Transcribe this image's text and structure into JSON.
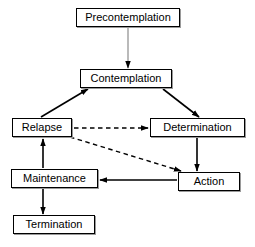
{
  "diagram": {
    "width": 255,
    "height": 247,
    "background_color": "#ffffff",
    "node_border_color": "#000000",
    "node_fill_color": "#ffffff",
    "node_shadow_color": "#9a9a9a",
    "solid_edge_color": "#000000",
    "faint_edge_color": "#8c8c8c",
    "dashed_edge_color": "#000000",
    "arrowhead_color": "#000000"
  },
  "nodes": [
    {
      "id": "precontemplation",
      "label": "Precontemplation",
      "x": 76,
      "y": 8,
      "w": 104,
      "h": 19
    },
    {
      "id": "contemplation",
      "label": "Contemplation",
      "x": 80,
      "y": 69,
      "w": 92,
      "h": 19
    },
    {
      "id": "relapse",
      "label": "Relapse",
      "x": 12,
      "y": 118,
      "w": 60,
      "h": 19
    },
    {
      "id": "determination",
      "label": "Determination",
      "x": 150,
      "y": 118,
      "w": 95,
      "h": 19
    },
    {
      "id": "maintenance",
      "label": "Maintenance",
      "x": 11,
      "y": 169,
      "w": 87,
      "h": 19
    },
    {
      "id": "action",
      "label": "Action",
      "x": 178,
      "y": 172,
      "w": 62,
      "h": 19
    },
    {
      "id": "termination",
      "label": "Termination",
      "x": 13,
      "y": 215,
      "w": 82,
      "h": 19
    }
  ],
  "edges": [
    {
      "id": "precontemplation-to-contemplation",
      "from": "precontemplation",
      "to": "contemplation",
      "style": "solid-faint",
      "x1": 128,
      "y1": 27,
      "x2": 128,
      "y2": 68
    },
    {
      "id": "relapse-to-contemplation",
      "from": "relapse",
      "to": "contemplation",
      "style": "solid",
      "x1": 41,
      "y1": 117,
      "x2": 88,
      "y2": 89
    },
    {
      "id": "contemplation-to-determination",
      "from": "contemplation",
      "to": "determination",
      "style": "solid",
      "x1": 163,
      "y1": 89,
      "x2": 199,
      "y2": 117
    },
    {
      "id": "relapse-to-determination",
      "from": "relapse",
      "to": "determination",
      "style": "dashed",
      "x1": 74,
      "y1": 128,
      "x2": 148,
      "y2": 128
    },
    {
      "id": "relapse-to-action",
      "from": "relapse",
      "to": "action",
      "style": "dashed",
      "x1": 70,
      "y1": 137,
      "x2": 181,
      "y2": 171
    },
    {
      "id": "determination-to-action",
      "from": "determination",
      "to": "action",
      "style": "solid",
      "x1": 197,
      "y1": 138,
      "x2": 197,
      "y2": 171
    },
    {
      "id": "action-to-maintenance",
      "from": "action",
      "to": "maintenance",
      "style": "solid",
      "x1": 177,
      "y1": 180,
      "x2": 100,
      "y2": 180
    },
    {
      "id": "maintenance-to-relapse",
      "from": "maintenance",
      "to": "relapse",
      "style": "solid",
      "x1": 43,
      "y1": 168,
      "x2": 43,
      "y2": 139
    },
    {
      "id": "maintenance-to-termination",
      "from": "maintenance",
      "to": "termination",
      "style": "solid",
      "x1": 43,
      "y1": 189,
      "x2": 43,
      "y2": 214
    }
  ]
}
